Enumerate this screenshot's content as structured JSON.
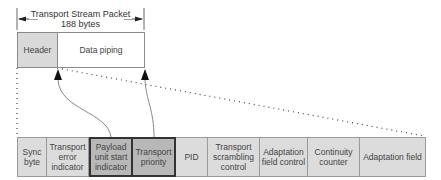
{
  "title": {
    "line1": "Transport Stream Packet",
    "line2": "188 bytes"
  },
  "packet": {
    "header_label": "Header",
    "payload_label": "Data piping"
  },
  "header_fields": [
    {
      "label": "Sync byte",
      "highlighted": false
    },
    {
      "label": "Transport error indicator",
      "highlighted": false
    },
    {
      "label": "Payload unit start indicator",
      "highlighted": true
    },
    {
      "label": "Transport priority",
      "highlighted": true
    },
    {
      "label": "PID",
      "highlighted": false
    },
    {
      "label": "Transport scrambling control",
      "highlighted": false
    },
    {
      "label": "Adaptation field control",
      "highlighted": false
    },
    {
      "label": "Continuity counter",
      "highlighted": false
    },
    {
      "label": "Adaptation field",
      "highlighted": false
    }
  ],
  "colors": {
    "header_fill": "#d9d9d9",
    "cell_fill": "#dcdcdc",
    "highlight_fill": "#b8b8b8",
    "highlight_border": "#333333"
  }
}
